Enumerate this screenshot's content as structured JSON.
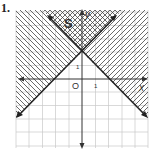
{
  "problem": {
    "number": "1."
  },
  "graph": {
    "region_label": "S",
    "x_axis_label": "x",
    "y_axis_label": "y",
    "origin_label": "O",
    "x_tick_label": "1",
    "y_tick_label": "1",
    "lines": [
      {
        "equation": "y = x + 2",
        "description": "line through (0,2) with slope 1, arrows both ends"
      },
      {
        "equation": "y = -x + 2",
        "description": "line through (0,2) with slope -1, arrows both ends"
      }
    ],
    "shading": {
      "left_region": "diagonal hatch (y >= x + 2 side / left)",
      "right_region": "diagonal hatch (right side)",
      "top_region": "cross-hatch overlap labeled S"
    },
    "grid": {
      "x_range": [
        -5,
        5
      ],
      "y_range": [
        -5,
        5
      ]
    }
  },
  "colors": {
    "line": "#222222",
    "grid": "#c8c8c8",
    "hatch": "#444444"
  }
}
